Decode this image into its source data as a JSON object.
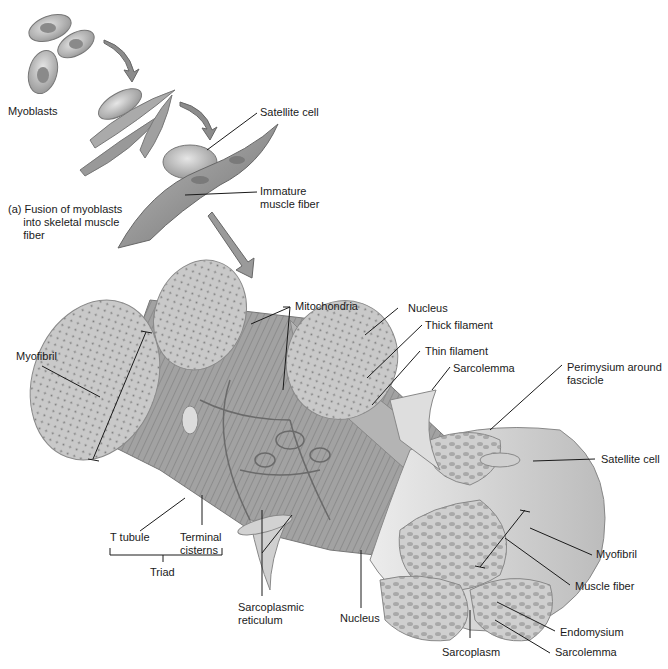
{
  "figure": {
    "part_a": {
      "caption": "(a) Fusion of myoblasts\n     into skeletal muscle\n     fiber",
      "labels": {
        "myoblasts": "Myoblasts",
        "satellite_cell": "Satellite cell",
        "immature_fiber": "Immature\nmuscle fiber"
      }
    },
    "part_b": {
      "labels": {
        "mitochondria": "Mitochondria",
        "myofibril_left": "Myofibril",
        "nucleus_top": "Nucleus",
        "thick_filament": "Thick filament",
        "thin_filament": "Thin filament",
        "sarcolemma_top": "Sarcolemma",
        "perimysium": "Perimysium around\nfascicle",
        "satellite_cell_right": "Satellite cell",
        "myofibril_right": "Myofibril",
        "muscle_fiber": "Muscle fiber",
        "endomysium": "Endomysium",
        "sarcolemma_bottom": "Sarcolemma",
        "sarcoplasm": "Sarcoplasm",
        "nucleus_bottom": "Nucleus",
        "sarcoplasmic_reticulum": "Sarcoplasmic\nreticulum",
        "t_tubule": "T tubule",
        "terminal_cisterns": "Terminal\ncisterns",
        "triad": "Triad"
      }
    },
    "colors": {
      "ink": "#1a1a1a",
      "tissue_light": "#d8d8d8",
      "tissue_mid": "#a8a8a8",
      "tissue_dark": "#6e6e6e",
      "background": "#ffffff"
    }
  }
}
